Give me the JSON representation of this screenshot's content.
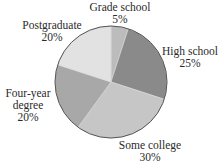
{
  "chart_data": {
    "type": "pie",
    "title": "",
    "center": [
      111,
      82
    ],
    "radius": 56,
    "start_angle_deg": 0,
    "direction": "clockwise",
    "slices": [
      {
        "label": "Grade school",
        "value": 5,
        "pct_label": "5%",
        "color": "#bcbcbc",
        "label_lines": [
          "Grade school"
        ],
        "label_pos": [
          120,
          1
        ]
      },
      {
        "label": "High school",
        "value": 25,
        "pct_label": "25%",
        "color": "#8a8a8a",
        "label_lines": [
          "High school"
        ],
        "label_pos": [
          190,
          45
        ]
      },
      {
        "label": "Some college",
        "value": 30,
        "pct_label": "30%",
        "color": "#c6c6c6",
        "label_lines": [
          "Some college"
        ],
        "label_pos": [
          150,
          139
        ]
      },
      {
        "label": "Four-year degree",
        "value": 20,
        "pct_label": "20%",
        "color": "#a8a8a8",
        "label_lines": [
          "Four-year",
          "degree"
        ],
        "label_pos": [
          28,
          87
        ]
      },
      {
        "label": "Postgraduate",
        "value": 20,
        "pct_label": "20%",
        "color": "#e2e2e2",
        "label_lines": [
          "Postgraduate"
        ],
        "label_pos": [
          52,
          19
        ]
      }
    ],
    "outline_color": "#555555"
  }
}
